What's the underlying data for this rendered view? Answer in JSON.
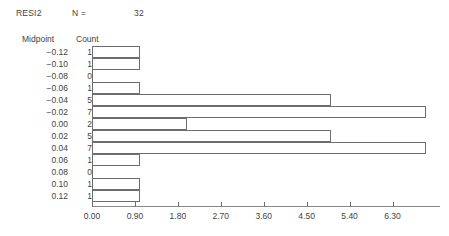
{
  "header": {
    "variable": "RESI2",
    "n_label": "N =",
    "n_value": "32"
  },
  "columns": {
    "midpoint": "Midpoint",
    "count": "Count"
  },
  "chart_data": {
    "type": "bar",
    "orientation": "horizontal",
    "title": "RESI2",
    "xlabel": "",
    "ylabel": "Midpoint",
    "categories": [
      "-0.12",
      "-0.10",
      "-0.08",
      "-0.06",
      "-0.04",
      "-0.02",
      "0.00",
      "0.02",
      "0.04",
      "0.06",
      "0.08",
      "0.10",
      "0.12"
    ],
    "values": [
      1,
      1,
      0,
      1,
      5,
      7,
      2,
      5,
      7,
      1,
      0,
      1,
      1
    ],
    "total": 32,
    "xlim": [
      0.0,
      7.3
    ],
    "xticks": [
      0.0,
      0.9,
      1.8,
      2.7,
      3.6,
      4.5,
      5.4,
      6.3
    ],
    "xticklabels": [
      "0.00",
      "0.90",
      "1.80",
      "2.70",
      "3.60",
      "4.50",
      "5.40",
      "6.30"
    ],
    "grid": false,
    "legend": false,
    "bar_fill": "#ffffff",
    "bar_edge": "#6d6d6d"
  },
  "rows": [
    {
      "midpoint": "−0.12",
      "count": "1"
    },
    {
      "midpoint": "−0.10",
      "count": "1"
    },
    {
      "midpoint": "−0.08",
      "count": "0"
    },
    {
      "midpoint": "−0.06",
      "count": "1"
    },
    {
      "midpoint": "−0.04",
      "count": "5"
    },
    {
      "midpoint": "−0.02",
      "count": "7"
    },
    {
      "midpoint": "0.00",
      "count": "2"
    },
    {
      "midpoint": "0.02",
      "count": "5"
    },
    {
      "midpoint": "0.04",
      "count": "7"
    },
    {
      "midpoint": "0.06",
      "count": "1"
    },
    {
      "midpoint": "0.08",
      "count": "0"
    },
    {
      "midpoint": "0.10",
      "count": "1"
    },
    {
      "midpoint": "0.12",
      "count": "1"
    }
  ],
  "xaxis": {
    "labels": [
      "0.00",
      "0.90",
      "1.80",
      "2.70",
      "3.60",
      "4.50",
      "5.40",
      "6.30"
    ]
  }
}
